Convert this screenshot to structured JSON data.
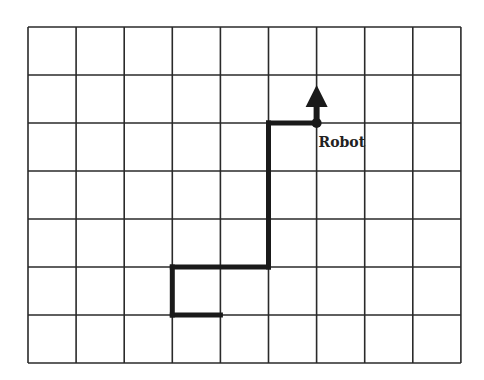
{
  "diagram": {
    "grid": {
      "columns": 9,
      "rows": 7
    },
    "path": {
      "points": [
        [
          4,
          6
        ],
        [
          3,
          6
        ],
        [
          3,
          5
        ],
        [
          5,
          5
        ],
        [
          5,
          2
        ],
        [
          6,
          2
        ]
      ],
      "color": "#1a1a1a"
    },
    "robot": {
      "label": "Robot",
      "position": [
        6,
        2
      ],
      "heading": "up"
    }
  }
}
